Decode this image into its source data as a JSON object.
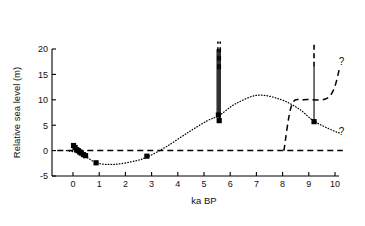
{
  "chart_data": {
    "type": "scatter",
    "title": "",
    "xlabel": "ka BP",
    "ylabel": "Relative sea level (m)",
    "xlim": [
      -0.8,
      10.4
    ],
    "ylim": [
      -5,
      20
    ],
    "xticks": [
      0,
      1,
      2,
      3,
      4,
      5,
      6,
      7,
      8,
      9,
      10
    ],
    "xticklabels": [
      "0",
      "1",
      "2",
      "3",
      "4",
      "5",
      "6",
      "7",
      "8",
      "9",
      "10"
    ],
    "yticks": [
      -5,
      0,
      5,
      10,
      15,
      20
    ],
    "yticklabels": [
      "-5",
      "0",
      "5",
      "10",
      "15",
      "20"
    ],
    "grid": false,
    "legend": null,
    "series": [
      {
        "name": "Sea level index points",
        "style": "filled-square-markers",
        "points": [
          {
            "x": 0.02,
            "y": 1.0
          },
          {
            "x": 0.08,
            "y": 0.6
          },
          {
            "x": 0.14,
            "y": 0.2
          },
          {
            "x": 0.2,
            "y": 0.0
          },
          {
            "x": 0.26,
            "y": -0.3
          },
          {
            "x": 0.32,
            "y": -0.5
          },
          {
            "x": 0.4,
            "y": -0.8
          },
          {
            "x": 0.48,
            "y": -1.0
          },
          {
            "x": 0.88,
            "y": -2.4
          },
          {
            "x": 2.82,
            "y": -1.1
          },
          {
            "x": 5.55,
            "y": 7.0
          },
          {
            "x": 5.58,
            "y": 5.9
          },
          {
            "x": 9.2,
            "y": 5.7
          }
        ]
      },
      {
        "name": "Interpolated sea level curve",
        "style": "dotted",
        "points": [
          {
            "x": -0.25,
            "y": 0.0
          },
          {
            "x": 0.3,
            "y": -0.6
          },
          {
            "x": 0.9,
            "y": -2.4
          },
          {
            "x": 1.6,
            "y": -2.7
          },
          {
            "x": 2.4,
            "y": -2.0
          },
          {
            "x": 2.9,
            "y": -1.1
          },
          {
            "x": 3.6,
            "y": 0.9
          },
          {
            "x": 4.4,
            "y": 3.6
          },
          {
            "x": 5.1,
            "y": 5.8
          },
          {
            "x": 5.6,
            "y": 7.0
          },
          {
            "x": 6.2,
            "y": 9.2
          },
          {
            "x": 7.05,
            "y": 10.9
          },
          {
            "x": 7.9,
            "y": 10.1
          },
          {
            "x": 8.6,
            "y": 8.3
          },
          {
            "x": 9.2,
            "y": 5.8
          },
          {
            "x": 9.9,
            "y": 4.0
          },
          {
            "x": 10.2,
            "y": 3.4
          }
        ]
      },
      {
        "name": "Present sea level datum",
        "style": "dashed-horizontal",
        "y": 0.0,
        "x_from": -0.6,
        "x_to": 10.3
      },
      {
        "name": "Alternative limiting envelope",
        "style": "dashed",
        "points": [
          {
            "x": 8.05,
            "y": 0.0
          },
          {
            "x": 8.35,
            "y": 9.0
          },
          {
            "x": 8.8,
            "y": 10.0
          },
          {
            "x": 9.6,
            "y": 10.1
          },
          {
            "x": 9.95,
            "y": 12.0
          },
          {
            "x": 10.18,
            "y": 16.4
          }
        ]
      }
    ],
    "error_bars": [
      {
        "x": 5.5,
        "y_from": 7.0,
        "y_to": 20.0,
        "style": "solid",
        "note": "limiting line extends above plot"
      },
      {
        "x": 5.54,
        "y_from": 7.0,
        "y_to": 20.0,
        "style": "solid"
      },
      {
        "x": 5.58,
        "y_from": 6.0,
        "y_to": 20.0,
        "style": "solid"
      },
      {
        "x": 5.62,
        "y_from": 6.0,
        "y_to": 20.0,
        "style": "solid"
      },
      {
        "x": 5.53,
        "y_from": 16.0,
        "y_to": 21.5,
        "style": "dashed"
      },
      {
        "x": 5.62,
        "y_from": 16.0,
        "y_to": 21.5,
        "style": "dashed"
      },
      {
        "x": 9.2,
        "y_from": 5.7,
        "y_to": 16.5,
        "style": "solid"
      },
      {
        "x": 9.2,
        "y_from": 16.5,
        "y_to": 21.5,
        "style": "dashed"
      }
    ],
    "annotations": [
      {
        "text": "?",
        "x": 10.25,
        "y": 16.9,
        "name": "upper-question-mark"
      },
      {
        "text": "?",
        "x": 10.25,
        "y": 3.0,
        "name": "lower-question-mark"
      }
    ]
  }
}
